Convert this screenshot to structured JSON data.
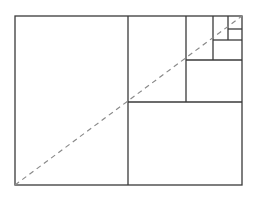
{
  "diagram": {
    "type": "golden-rectangle-subdivision",
    "canvas": {
      "width": 256,
      "height": 200,
      "background": "#ffffff"
    },
    "colors": {
      "line": "#3a3a3a",
      "diagonal": "#8a8a8a"
    },
    "outer_rect": {
      "x": 15,
      "y": 16,
      "w": 227,
      "h": 169
    },
    "lines": [
      {
        "x1": 128,
        "y1": 16,
        "x2": 128,
        "y2": 185
      },
      {
        "x1": 128,
        "y1": 102,
        "x2": 242,
        "y2": 102
      },
      {
        "x1": 186,
        "y1": 16,
        "x2": 186,
        "y2": 102
      },
      {
        "x1": 186,
        "y1": 60,
        "x2": 242,
        "y2": 60
      },
      {
        "x1": 213,
        "y1": 16,
        "x2": 213,
        "y2": 60
      },
      {
        "x1": 213,
        "y1": 40,
        "x2": 242,
        "y2": 40
      },
      {
        "x1": 228,
        "y1": 16,
        "x2": 228,
        "y2": 40
      },
      {
        "x1": 228,
        "y1": 29,
        "x2": 242,
        "y2": 29
      }
    ],
    "diagonal": {
      "x1": 15,
      "y1": 185,
      "x2": 242,
      "y2": 16,
      "style": "dashed"
    }
  }
}
